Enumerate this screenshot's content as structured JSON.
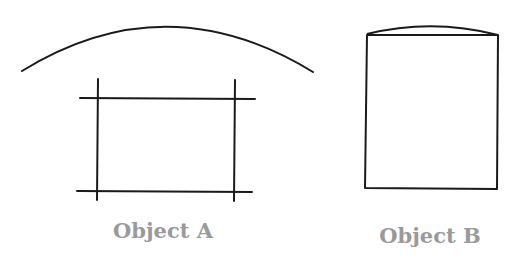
{
  "objects": [
    {
      "id": "A",
      "label": "Object A"
    },
    {
      "id": "B",
      "label": "Object B"
    }
  ],
  "colors": {
    "stroke": "#1a1a1a",
    "label": "#9a9a9a",
    "background": "#ffffff"
  }
}
